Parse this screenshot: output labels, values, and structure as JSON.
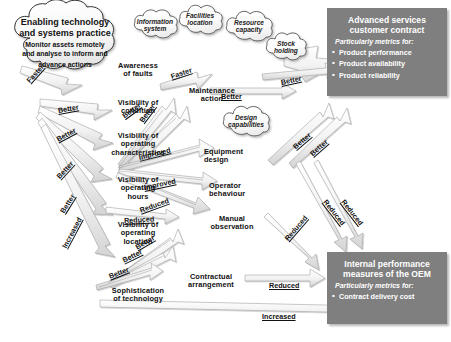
{
  "diagram": {
    "type": "influence-diagram"
  },
  "source_cloud": {
    "heading_line1": "Enabling technology",
    "heading_line2": "and systems practice",
    "body_line1": "Monitor assets remotely",
    "body_line2": "and analyse to inform and",
    "body_line3": "advance actions"
  },
  "context_clouds": [
    {
      "id": "information-system",
      "line1": "Information",
      "line2": "system"
    },
    {
      "id": "facilities-location",
      "line1": "Facilities",
      "line2": "location"
    },
    {
      "id": "resource-capacity",
      "line1": "Resource",
      "line2": "capacity"
    },
    {
      "id": "stock-holding",
      "line1": "Stock",
      "line2": "holding"
    },
    {
      "id": "design-capabilities",
      "line1": "Design",
      "line2": "capabilities"
    }
  ],
  "left_nodes": [
    {
      "id": "visibility-of-condition",
      "line1": "Visibility of",
      "line2": "condition",
      "line3": ""
    },
    {
      "id": "visibility-of-operating-characteristics",
      "line1": "Visibility of",
      "line2": "operating",
      "line3": "characteristics"
    },
    {
      "id": "visibility-of-operating-hours",
      "line1": "Visibility of",
      "line2": "operating",
      "line3": "hours"
    },
    {
      "id": "visibility-of-operating-location",
      "line1": "Visibility of",
      "line2": "operating",
      "line3": "location"
    },
    {
      "id": "sophistication-of-technology",
      "line1": "Sophistication",
      "line2": "of technology",
      "line3": ""
    }
  ],
  "middle_nodes": [
    {
      "id": "awareness-of-faults",
      "line1": "Awareness",
      "line2": "of faults",
      "line3": ""
    },
    {
      "id": "maintenance-action",
      "line1": "Maintenance",
      "line2": "action",
      "line3": ""
    },
    {
      "id": "equipment-design",
      "line1": "Equipment",
      "line2": "design",
      "line3": ""
    },
    {
      "id": "operator-behaviour",
      "line1": "Operator",
      "line2": "behaviour",
      "line3": ""
    },
    {
      "id": "manual-observation",
      "line1": "Manual",
      "line2": "observation",
      "line3": ""
    },
    {
      "id": "contractual-arrangement",
      "line1": "Contractual",
      "line2": "arrangement",
      "line3": ""
    }
  ],
  "panels": [
    {
      "id": "advanced-services-customer-contract",
      "title_line1": "Advanced services",
      "title_line2": "customer contract",
      "subtitle": "Particularly metrics for:",
      "items": [
        "Product performance",
        "Product availability",
        "Product reliability"
      ],
      "color": "#7f7f7f"
    },
    {
      "id": "internal-performance-measures-of-the-oem",
      "title_line1": "Internal performance",
      "title_line2": "measures of the OEM",
      "subtitle": "Particularly metrics for:",
      "items": [
        "Contract delivery cost"
      ],
      "color": "#7f7f7f"
    }
  ],
  "arrow_labels": [
    {
      "id": "arrow-label-faster-1",
      "text": "Faster",
      "x": 28,
      "y": 77,
      "rot": -48
    },
    {
      "id": "arrow-label-faster-2",
      "text": "Faster",
      "x": 171,
      "y": 72,
      "rot": -18
    },
    {
      "id": "arrow-label-better-1",
      "text": "Better",
      "x": 58,
      "y": 106,
      "rot": -10
    },
    {
      "id": "arrow-label-better-2",
      "text": "Better",
      "x": 57,
      "y": 135,
      "rot": -28
    },
    {
      "id": "arrow-label-better-3",
      "text": "Better",
      "x": 58,
      "y": 173,
      "rot": -47
    },
    {
      "id": "arrow-label-better-4",
      "text": "Better",
      "x": 62,
      "y": 208,
      "rot": -58
    },
    {
      "id": "arrow-label-increased-1",
      "text": "Increased",
      "x": 64,
      "y": 243,
      "rot": -62
    },
    {
      "id": "arrow-label-better-5",
      "text": "Better",
      "x": 123,
      "y": 112,
      "rot": -36
    },
    {
      "id": "arrow-label-better-6",
      "text": "Better",
      "x": 141,
      "y": 117,
      "rot": -53
    },
    {
      "id": "arrow-label-improved-1",
      "text": "Improved",
      "x": 139,
      "y": 153,
      "rot": -14
    },
    {
      "id": "arrow-label-improved-2",
      "text": "Improved",
      "x": 144,
      "y": 183,
      "rot": -12
    },
    {
      "id": "arrow-label-reduced-1",
      "text": "Reduced",
      "x": 140,
      "y": 206,
      "rot": -20
    },
    {
      "id": "arrow-label-reduced-2",
      "text": "Reduced",
      "x": 124,
      "y": 216,
      "rot": -3
    },
    {
      "id": "arrow-label-better-7",
      "text": "Better",
      "x": 136,
      "y": 243,
      "rot": -30
    },
    {
      "id": "arrow-label-better-8",
      "text": "Better",
      "x": 123,
      "y": 256,
      "rot": -26
    },
    {
      "id": "arrow-label-better-9",
      "text": "Better",
      "x": 109,
      "y": 272,
      "rot": -21
    },
    {
      "id": "arrow-label-better-10",
      "text": "Better",
      "x": 221,
      "y": 92,
      "rot": 0
    },
    {
      "id": "arrow-label-better-11",
      "text": "Better",
      "x": 281,
      "y": 78,
      "rot": -12
    },
    {
      "id": "arrow-label-better-12",
      "text": "Better",
      "x": 294,
      "y": 143,
      "rot": -40
    },
    {
      "id": "arrow-label-better-13",
      "text": "Better",
      "x": 311,
      "y": 150,
      "rot": -41
    },
    {
      "id": "arrow-label-reduced-3",
      "text": "Reduced",
      "x": 286,
      "y": 235,
      "rot": -49
    },
    {
      "id": "arrow-label-reduced-4",
      "text": "Reduced",
      "x": 325,
      "y": 196,
      "rot": 52
    },
    {
      "id": "arrow-label-reduced-5",
      "text": "Reduced",
      "x": 343,
      "y": 196,
      "rot": 52
    },
    {
      "id": "arrow-label-reduced-6",
      "text": "Reduced",
      "x": 269,
      "y": 281,
      "rot": 0
    },
    {
      "id": "arrow-label-increased-2",
      "text": "Increased",
      "x": 262,
      "y": 312,
      "rot": 0
    }
  ]
}
